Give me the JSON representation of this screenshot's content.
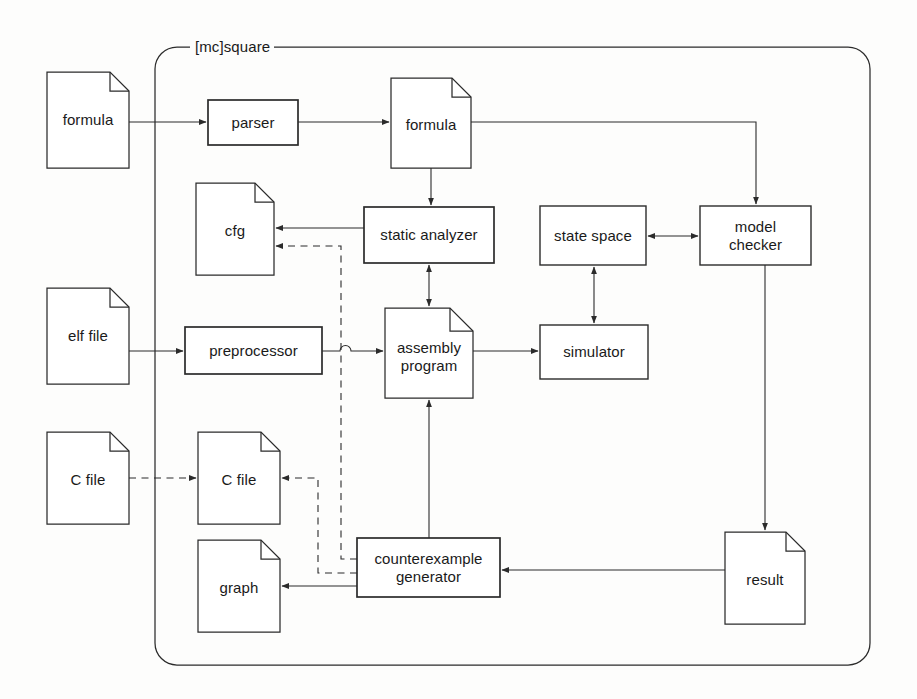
{
  "diagram": {
    "title": "[mc]square",
    "boundary": {
      "label": "[mc]square",
      "x": 155,
      "y": 47,
      "w": 715,
      "h": 618,
      "radius": 22
    },
    "colors": {
      "stroke": "#2b2b2b",
      "background": "#fdfdfc",
      "text": "#1a1a1a"
    },
    "nodes": [
      {
        "id": "formula_in",
        "label": "formula",
        "shape": "document",
        "x": 47,
        "y": 72,
        "w": 82,
        "h": 96,
        "inside": false
      },
      {
        "id": "parser",
        "label": "parser",
        "shape": "process",
        "x": 208,
        "y": 100,
        "w": 90,
        "h": 45,
        "inside": true
      },
      {
        "id": "formula_mid",
        "label": "formula",
        "shape": "document",
        "x": 391,
        "y": 78,
        "w": 80,
        "h": 90,
        "inside": true
      },
      {
        "id": "cfg",
        "label": "cfg",
        "shape": "document",
        "x": 196,
        "y": 183,
        "w": 78,
        "h": 92,
        "inside": true
      },
      {
        "id": "static",
        "label": "static analyzer",
        "shape": "process",
        "x": 364,
        "y": 207,
        "w": 130,
        "h": 56,
        "inside": true
      },
      {
        "id": "state_space",
        "label": "state space",
        "shape": "process",
        "x": 540,
        "y": 206,
        "w": 106,
        "h": 59,
        "inside": true
      },
      {
        "id": "model_check",
        "label": "model\nchecker",
        "shape": "process",
        "x": 700,
        "y": 206,
        "w": 111,
        "h": 59,
        "inside": true
      },
      {
        "id": "elf_file",
        "label": "elf file",
        "shape": "document",
        "x": 47,
        "y": 288,
        "w": 82,
        "h": 96,
        "inside": false
      },
      {
        "id": "preprocessor",
        "label": "preprocessor",
        "shape": "process",
        "x": 185,
        "y": 327,
        "w": 137,
        "h": 47,
        "inside": true
      },
      {
        "id": "assembly",
        "label": "assembly\nprogram",
        "shape": "document",
        "x": 385,
        "y": 308,
        "w": 88,
        "h": 90,
        "inside": true
      },
      {
        "id": "simulator",
        "label": "simulator",
        "shape": "process",
        "x": 540,
        "y": 325,
        "w": 108,
        "h": 54,
        "inside": true
      },
      {
        "id": "c_file_out",
        "label": "C file",
        "shape": "document",
        "x": 47,
        "y": 432,
        "w": 82,
        "h": 92,
        "inside": false
      },
      {
        "id": "c_file_in",
        "label": "C file",
        "shape": "document",
        "x": 198,
        "y": 432,
        "w": 82,
        "h": 92,
        "inside": true
      },
      {
        "id": "graph",
        "label": "graph",
        "shape": "document",
        "x": 198,
        "y": 540,
        "w": 82,
        "h": 92,
        "inside": true
      },
      {
        "id": "ce_generator",
        "label": "counterexample\ngenerator",
        "shape": "process",
        "x": 357,
        "y": 538,
        "w": 143,
        "h": 59,
        "inside": true
      },
      {
        "id": "result",
        "label": "result",
        "shape": "document",
        "x": 725,
        "y": 532,
        "w": 80,
        "h": 92,
        "inside": true
      }
    ],
    "edges": [
      {
        "from": "formula_in",
        "to": "parser",
        "style": "solid",
        "arrow": "end"
      },
      {
        "from": "parser",
        "to": "formula_mid",
        "style": "solid",
        "arrow": "end"
      },
      {
        "from": "formula_mid",
        "to": "model_check",
        "style": "solid",
        "arrow": "end"
      },
      {
        "from": "formula_mid",
        "to": "static",
        "style": "solid",
        "arrow": "end"
      },
      {
        "from": "static",
        "to": "cfg",
        "style": "solid",
        "arrow": "end"
      },
      {
        "from": "static",
        "to": "assembly",
        "style": "solid",
        "arrow": "both"
      },
      {
        "from": "state_space",
        "to": "model_check",
        "style": "solid",
        "arrow": "both"
      },
      {
        "from": "simulator",
        "to": "state_space",
        "style": "solid",
        "arrow": "both"
      },
      {
        "from": "elf_file",
        "to": "preprocessor",
        "style": "solid",
        "arrow": "end"
      },
      {
        "from": "preprocessor",
        "to": "assembly",
        "style": "solid",
        "arrow": "end"
      },
      {
        "from": "assembly",
        "to": "simulator",
        "style": "solid",
        "arrow": "end"
      },
      {
        "from": "model_check",
        "to": "result",
        "style": "solid",
        "arrow": "end"
      },
      {
        "from": "result",
        "to": "ce_generator",
        "style": "solid",
        "arrow": "end"
      },
      {
        "from": "ce_generator",
        "to": "assembly",
        "style": "solid",
        "arrow": "end"
      },
      {
        "from": "ce_generator",
        "to": "graph",
        "style": "solid",
        "arrow": "end"
      },
      {
        "from": "ce_generator",
        "to": "cfg",
        "style": "dashed",
        "arrow": "end"
      },
      {
        "from": "ce_generator",
        "to": "c_file_in",
        "style": "dashed",
        "arrow": "end"
      },
      {
        "from": "c_file_out",
        "to": "c_file_in",
        "style": "dashed",
        "arrow": "end"
      }
    ]
  }
}
